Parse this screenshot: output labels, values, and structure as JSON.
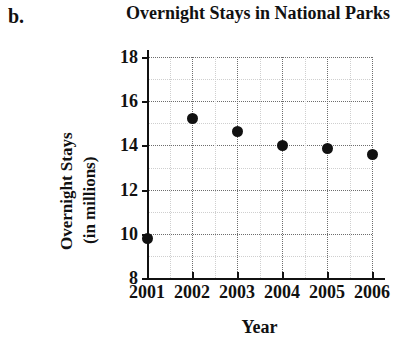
{
  "part_label": "b.",
  "chart_data": {
    "type": "scatter",
    "title": "Overnight Stays in National Parks",
    "xlabel": "Year",
    "ylabel_line1": "Overnight Stays",
    "ylabel_line2": "(in millions)",
    "categories": [
      "2001",
      "2002",
      "2003",
      "2004",
      "2005",
      "2006"
    ],
    "x": [
      2001,
      2002,
      2003,
      2004,
      2005,
      2006
    ],
    "values": [
      9.8,
      15.2,
      14.65,
      14.0,
      13.85,
      13.6
    ],
    "series": [
      {
        "name": "Overnight Stays",
        "values": [
          9.8,
          15.2,
          14.65,
          14.0,
          13.85,
          13.6
        ]
      }
    ],
    "xlim": [
      2001,
      2006
    ],
    "ylim": [
      8,
      18
    ],
    "y_ticks": [
      8,
      10,
      12,
      14,
      16,
      18
    ],
    "y_tick_labels": [
      "8",
      "10",
      "12",
      "14",
      "16",
      "18"
    ],
    "x_ticks": [
      2001,
      2002,
      2003,
      2004,
      2005,
      2006
    ],
    "x_tick_labels": [
      "2001",
      "2002",
      "2003",
      "2004",
      "2005",
      "2006"
    ],
    "y_minor_ticks": [
      9,
      11,
      13,
      15,
      17
    ],
    "grid": true,
    "grid_style": "dotted",
    "legend": null,
    "marker": "filled-circle",
    "marker_color": "#111111"
  }
}
